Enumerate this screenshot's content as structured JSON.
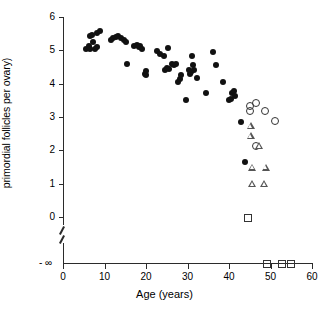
{
  "chart_data": {
    "type": "scatter",
    "title": "",
    "xlabel": "Age (years)",
    "ylabel": "Log (number of remaining\nprimordial follicles per ovary)",
    "xlim": [
      0,
      60
    ],
    "ylim": [
      0,
      6
    ],
    "xticks": [
      0,
      10,
      20,
      30,
      40,
      50,
      60
    ],
    "yticks": [
      0,
      1,
      2,
      3,
      4,
      5,
      6
    ],
    "y_axis_break": true,
    "y_axis_break_label": "- ∞",
    "grid": false,
    "legend": "none",
    "series": [
      {
        "name": "filled-circle",
        "marker": "filled-circle",
        "points": [
          [
            5.6,
            5.05
          ],
          [
            6.2,
            5.12
          ],
          [
            6.4,
            5.42
          ],
          [
            6.5,
            5.05
          ],
          [
            7.0,
            5.45
          ],
          [
            7.3,
            5.25
          ],
          [
            7.6,
            5.05
          ],
          [
            8.1,
            5.1
          ],
          [
            8.3,
            5.52
          ],
          [
            9.0,
            5.58
          ],
          [
            11.5,
            5.32
          ],
          [
            12.0,
            5.38
          ],
          [
            12.8,
            5.4
          ],
          [
            13.3,
            5.42
          ],
          [
            13.9,
            5.38
          ],
          [
            14.6,
            5.3
          ],
          [
            15.2,
            5.25
          ],
          [
            15.4,
            4.6
          ],
          [
            17.0,
            5.12
          ],
          [
            17.8,
            5.15
          ],
          [
            18.2,
            5.1
          ],
          [
            18.6,
            5.12
          ],
          [
            19.0,
            5.05
          ],
          [
            19.8,
            4.3
          ],
          [
            20.0,
            4.25
          ],
          [
            20.1,
            4.38
          ],
          [
            22.6,
            4.98
          ],
          [
            23.3,
            4.9
          ],
          [
            24.4,
            4.82
          ],
          [
            24.6,
            4.42
          ],
          [
            25.0,
            4.48
          ],
          [
            25.2,
            5.08
          ],
          [
            25.6,
            4.45
          ],
          [
            26.3,
            4.6
          ],
          [
            26.8,
            4.55
          ],
          [
            27.3,
            4.6
          ],
          [
            27.8,
            4.05
          ],
          [
            28.2,
            4.15
          ],
          [
            28.5,
            4.25
          ],
          [
            29.6,
            3.5
          ],
          [
            30.3,
            4.42
          ],
          [
            30.6,
            4.3
          ],
          [
            30.9,
            4.35
          ],
          [
            31.1,
            4.82
          ],
          [
            31.3,
            4.55
          ],
          [
            31.6,
            4.42
          ],
          [
            32.3,
            4.18
          ],
          [
            34.5,
            3.72
          ],
          [
            36.2,
            4.95
          ],
          [
            36.8,
            4.55
          ],
          [
            38.6,
            4.05
          ],
          [
            40.0,
            3.5
          ],
          [
            40.5,
            3.55
          ],
          [
            40.8,
            3.72
          ],
          [
            41.1,
            3.78
          ],
          [
            41.4,
            3.62
          ],
          [
            42.8,
            2.85
          ],
          [
            43.8,
            1.65
          ]
        ]
      },
      {
        "name": "open-circle",
        "marker": "open-circle",
        "points": [
          [
            45.0,
            3.2
          ],
          [
            45.0,
            3.35
          ],
          [
            46.3,
            3.45
          ],
          [
            48.6,
            3.2
          ],
          [
            50.9,
            2.9
          ],
          [
            46.5,
            2.15
          ]
        ]
      },
      {
        "name": "open-triangle",
        "marker": "open-triangle",
        "points": [
          [
            45.3,
            2.75
          ],
          [
            45.3,
            2.45
          ],
          [
            47.3,
            2.15
          ],
          [
            45.6,
            1.5
          ],
          [
            48.9,
            1.5
          ],
          [
            45.6,
            1.0
          ],
          [
            48.5,
            1.0
          ]
        ]
      },
      {
        "name": "open-square",
        "marker": "open-square",
        "points": [
          [
            44.5,
            0.0
          ]
        ]
      },
      {
        "name": "open-square-neg-inf",
        "marker": "open-square",
        "at_neg_infinity": true,
        "points": [
          [
            49.0,
            null
          ],
          [
            52.7,
            null
          ],
          [
            54.9,
            null
          ]
        ]
      }
    ]
  }
}
